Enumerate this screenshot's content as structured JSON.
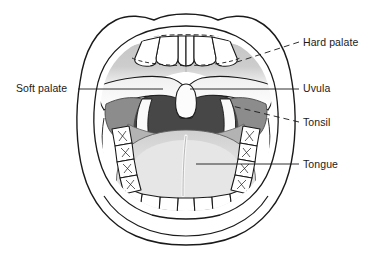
{
  "figure": {
    "caption_partial": "",
    "background_color": "#ffffff",
    "line_color": "#1a1a1a",
    "label_color": "#1a1a1a"
  },
  "labels": [
    {
      "id": "hard-palate",
      "text": "Hard palate",
      "side": "right",
      "x": 303,
      "y": 36,
      "leader_style": "dashed",
      "leader": {
        "x1": 299,
        "y1": 42,
        "x2": 237,
        "y2": 62
      }
    },
    {
      "id": "uvula",
      "text": "Uvula",
      "side": "right",
      "x": 303,
      "y": 82,
      "leader_style": "solid",
      "leader": {
        "x1": 299,
        "y1": 89,
        "x2": 190,
        "y2": 89
      }
    },
    {
      "id": "tonsil",
      "text": "Tonsil",
      "side": "right",
      "x": 303,
      "y": 116,
      "leader_style": "dashed",
      "leader": {
        "x1": 299,
        "y1": 122,
        "x2": 232,
        "y2": 106
      }
    },
    {
      "id": "tongue",
      "text": "Tongue",
      "side": "right",
      "x": 303,
      "y": 158,
      "leader_style": "solid",
      "leader": {
        "x1": 299,
        "y1": 164,
        "x2": 196,
        "y2": 164
      }
    },
    {
      "id": "soft-palate",
      "text": "Soft palate",
      "side": "left",
      "x": 16,
      "y": 82,
      "leader_style": "solid",
      "leader": {
        "x1": 78,
        "y1": 89,
        "x2": 163,
        "y2": 89
      }
    }
  ],
  "structures": [
    {
      "id": "lips-outer",
      "name": "Outer lip / mouth opening outline",
      "fill": "#ffffff",
      "stroke": "#1a1a1a"
    },
    {
      "id": "lips-inner",
      "name": "Inner lip margin",
      "fill": "#ffffff",
      "stroke": "#1a1a1a"
    },
    {
      "id": "hard-palate",
      "name": "Hard palate",
      "fill": "#c9c9c9",
      "stroke": "#6e6e6e"
    },
    {
      "id": "soft-palate",
      "name": "Soft palate",
      "fill": "#ffffff",
      "stroke": "#1a1a1a"
    },
    {
      "id": "uvula",
      "name": "Uvula",
      "fill": "#fbfbfb",
      "stroke": "#1a1a1a"
    },
    {
      "id": "oropharynx",
      "name": "Oropharynx (throat opening)",
      "fill": "#3f3f3f",
      "stroke": "#1a1a1a"
    },
    {
      "id": "tonsil-left",
      "name": "Left palatine tonsil",
      "fill": "#8f8f8f",
      "stroke": "#4a4a4a"
    },
    {
      "id": "tonsil-right",
      "name": "Right palatine tonsil",
      "fill": "#8f8f8f",
      "stroke": "#4a4a4a"
    },
    {
      "id": "tongue",
      "name": "Tongue",
      "fill": "#dcdcdc",
      "stroke": "#5a5a5a"
    },
    {
      "id": "tongue-back",
      "name": "Posterior tongue / base",
      "fill": "#b4b4b4",
      "stroke": "#5a5a5a"
    },
    {
      "id": "median-sulcus",
      "name": "Median sulcus of tongue",
      "fill": "#f2f2f2",
      "stroke": "#8a8a8a"
    },
    {
      "id": "upper-teeth",
      "name": "Upper incisors",
      "fill": "#ffffff",
      "stroke": "#1a1a1a"
    },
    {
      "id": "lower-teeth",
      "name": "Lower incisors",
      "fill": "#ffffff",
      "stroke": "#1a1a1a"
    },
    {
      "id": "molars-left",
      "name": "Left molars and premolars",
      "fill": "#ffffff",
      "stroke": "#1a1a1a"
    },
    {
      "id": "molars-right",
      "name": "Right molars and premolars",
      "fill": "#ffffff",
      "stroke": "#1a1a1a"
    }
  ]
}
